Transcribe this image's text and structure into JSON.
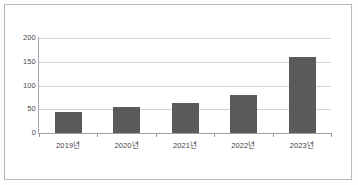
{
  "chart_data": {
    "type": "bar",
    "title": "",
    "subtitle": "",
    "xlabel": "",
    "ylabel": "",
    "categories": [
      "2019년",
      "2020년",
      "2021년",
      "2022년",
      "2023년"
    ],
    "values": [
      44,
      55,
      63,
      81,
      160
    ],
    "series": [
      {
        "name": "",
        "values": [
          44,
          55,
          63,
          81,
          160
        ]
      }
    ],
    "ylim": [
      0,
      200
    ],
    "yticks": [
      0,
      50,
      100,
      150,
      200
    ],
    "ytick_labels": [
      "0",
      "50",
      "100",
      "150",
      "200"
    ],
    "grid": true,
    "grid_axis": "y",
    "legend": false,
    "legend_position": "none",
    "bar_color": "#5a5a5a",
    "gridline_color": "#d4d4d4",
    "axis_color": "#a0a0a0",
    "background_color": "#ffffff",
    "border_color": "#b9b9b9",
    "annotations": []
  }
}
